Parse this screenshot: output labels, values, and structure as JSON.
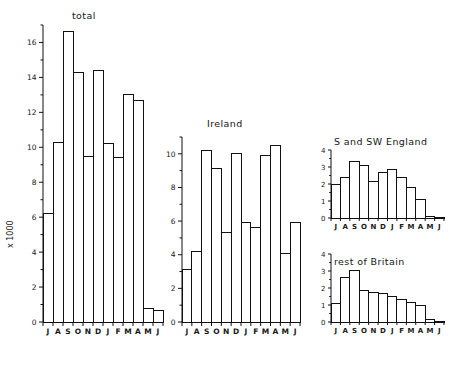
{
  "figure": {
    "background": "#ffffff",
    "ink_color": "#111111"
  },
  "chart_data": [
    {
      "id": "total",
      "type": "bar",
      "title": "total",
      "xlabel": "",
      "ylabel": "x 1000",
      "categories": [
        "J",
        "A",
        "S",
        "O",
        "N",
        "D",
        "J",
        "F",
        "M",
        "A",
        "M",
        "J"
      ],
      "values": [
        6.2,
        10.3,
        16.6,
        14.3,
        9.5,
        14.4,
        10.2,
        9.4,
        13.0,
        12.7,
        0.75,
        0.65
      ],
      "ylim": [
        0,
        17
      ],
      "yticks": [
        0,
        2,
        4,
        6,
        8,
        10,
        12,
        14,
        16
      ],
      "ytick_labels": [
        "0",
        "2",
        "4",
        "6",
        "8",
        "10",
        "12",
        "14",
        "16"
      ],
      "minor_yticks": [
        1,
        3,
        5,
        7,
        9,
        11,
        13,
        15,
        17
      ],
      "grid": false,
      "legend": "none"
    },
    {
      "id": "ireland",
      "type": "bar",
      "title": "Ireland",
      "xlabel": "",
      "ylabel": "",
      "categories": [
        "J",
        "A",
        "S",
        "O",
        "N",
        "D",
        "J",
        "F",
        "M",
        "A",
        "M",
        "J"
      ],
      "values": [
        3.1,
        4.2,
        10.2,
        9.1,
        5.3,
        10.0,
        5.9,
        5.6,
        9.9,
        10.5,
        4.1,
        5.9
      ],
      "ylim": [
        0,
        11
      ],
      "yticks": [
        0,
        2,
        4,
        6,
        8,
        10
      ],
      "ytick_labels": [
        "0",
        "2",
        "4",
        "6",
        "8",
        "10"
      ],
      "minor_yticks": [
        1,
        3,
        5,
        7,
        9,
        11
      ],
      "grid": false,
      "legend": "none"
    },
    {
      "id": "s-and-sw-england",
      "type": "bar",
      "title": "S and SW England",
      "xlabel": "",
      "ylabel": "",
      "categories": [
        "J",
        "A",
        "S",
        "O",
        "N",
        "D",
        "J",
        "F",
        "M",
        "A",
        "M",
        "J"
      ],
      "values": [
        2.0,
        2.4,
        3.3,
        3.1,
        2.15,
        2.7,
        2.85,
        2.4,
        1.8,
        1.1,
        0.1,
        0.05
      ],
      "ylim": [
        0,
        4
      ],
      "yticks": [
        0,
        1,
        2,
        3,
        4
      ],
      "ytick_labels": [
        "0",
        "1",
        "2",
        "3",
        "4"
      ],
      "minor_yticks": [
        0.5,
        1.5,
        2.5,
        3.5
      ],
      "grid": false,
      "legend": "none"
    },
    {
      "id": "rest-of-britain",
      "type": "bar",
      "title": "rest of Britain",
      "xlabel": "",
      "ylabel": "",
      "categories": [
        "J",
        "A",
        "S",
        "O",
        "N",
        "D",
        "J",
        "F",
        "M",
        "A",
        "M",
        "J"
      ],
      "values": [
        1.1,
        2.6,
        3.05,
        1.85,
        1.75,
        1.65,
        1.5,
        1.3,
        1.15,
        0.95,
        0.15,
        0.05
      ],
      "ylim": [
        0,
        4
      ],
      "yticks": [
        0,
        1,
        2,
        3,
        4
      ],
      "ytick_labels": [
        "0",
        "1",
        "2",
        "3",
        "4"
      ],
      "minor_yticks": [
        0.5,
        1.5,
        2.5,
        3.5
      ],
      "grid": false,
      "legend": "none"
    }
  ]
}
